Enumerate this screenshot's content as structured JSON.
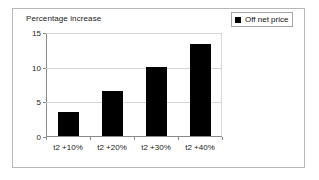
{
  "frame": {
    "border_color": "#b9b9b9",
    "background": "#ffffff"
  },
  "legend": {
    "entries": [
      {
        "label": "Off net price",
        "color": "#000000",
        "marker": "square-swatch"
      }
    ]
  },
  "chart_data": {
    "type": "bar",
    "title": "Percentage increase",
    "xlabel": "",
    "ylabel": "",
    "categories": [
      "t2 +10%",
      "t2 +20%",
      "t2 +30%",
      "t2 +40%"
    ],
    "values": [
      3.4,
      6.5,
      10.0,
      13.2
    ],
    "series": [
      {
        "name": "Off net price",
        "color": "#000000",
        "values": [
          3.4,
          6.5,
          10.0,
          13.2
        ]
      }
    ],
    "ylim": [
      0,
      15
    ],
    "yticks": [
      0,
      5,
      10,
      15
    ],
    "ytick_labels": [
      "0",
      "5",
      "10",
      "15"
    ],
    "grid": true,
    "grid_axis": "y",
    "legend_position": "top-right",
    "bar_color": "#000000"
  }
}
